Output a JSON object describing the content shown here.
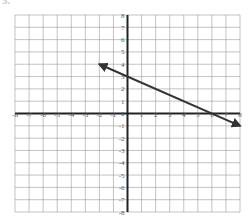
{
  "problem_number": "3.",
  "colors": {
    "grid": "#9a9a9a",
    "axis": "#222222",
    "line": "#333333",
    "label": "#555555"
  },
  "chart_data": {
    "type": "line",
    "title": "",
    "xlabel": "",
    "ylabel": "",
    "xlim": [
      -8,
      8
    ],
    "ylim": [
      -8,
      8
    ],
    "grid": true,
    "x_ticks": [
      -8,
      -7,
      -6,
      -5,
      -4,
      -3,
      -2,
      -1,
      1,
      2,
      3,
      4,
      5,
      6,
      7,
      8
    ],
    "y_ticks": [
      8,
      7,
      6,
      5,
      4,
      3,
      2,
      1,
      0,
      -1,
      -2,
      -3,
      -4,
      -5,
      -6,
      -7,
      -8
    ],
    "series": [
      {
        "name": "line",
        "slope": -0.5,
        "intercept": 3,
        "x": [
          -2,
          0,
          6,
          8
        ],
        "y": [
          4,
          3,
          0,
          -1
        ],
        "arrows": "both"
      }
    ]
  },
  "layout": {
    "left": 15,
    "right": 240,
    "top": 15,
    "bottom": 212
  }
}
